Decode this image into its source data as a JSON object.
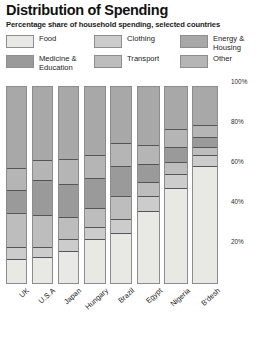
{
  "header": {
    "title": "Distribution of Spending",
    "subtitle": "Percentage share of household spending, selected countries"
  },
  "legend": {
    "items": [
      {
        "label": "Food",
        "color": "#e8e8e4",
        "key": "food"
      },
      {
        "label": "Medicine &\nEducation",
        "color": "#9a9a9a",
        "key": "medicine_education"
      },
      {
        "label": "Clothing",
        "color": "#cccccc",
        "key": "clothing"
      },
      {
        "label": "Transport",
        "color": "#bdbdbd",
        "key": "transport"
      },
      {
        "label": "Energy &\nHousing",
        "color": "#a8a8a8",
        "key": "energy_housing"
      },
      {
        "label": "Other",
        "color": "#b5b5b5",
        "key": "other"
      }
    ]
  },
  "axis": {
    "ticks": [
      {
        "label": "100%",
        "value": 100
      },
      {
        "label": "80%",
        "value": 80
      },
      {
        "label": "60%",
        "value": 60
      },
      {
        "label": "40%",
        "value": 40
      },
      {
        "label": "20%",
        "value": 20
      }
    ],
    "max": 100,
    "min": 0
  },
  "chart_data": {
    "type": "bar",
    "stacked": true,
    "title": "Distribution of Spending",
    "subtitle": "Percentage share of household spending, selected countries",
    "xlabel": "",
    "ylabel": "",
    "ylim": [
      0,
      100
    ],
    "grid": false,
    "legend_position": "top",
    "categories": [
      "UK",
      "U.S.A",
      "Japan",
      "Hungary",
      "Brazil",
      "Egypt",
      "Nigeria",
      "B'desh"
    ],
    "series": [
      {
        "name": "Food",
        "color": "#e8e8e4",
        "values": [
          12,
          13,
          16,
          22,
          25,
          36,
          48,
          59
        ]
      },
      {
        "name": "Clothing",
        "color": "#cccccc",
        "values": [
          6,
          5,
          6,
          6,
          7,
          8,
          7,
          6
        ]
      },
      {
        "name": "Transport",
        "color": "#bdbdbd",
        "values": [
          17,
          16,
          11,
          10,
          12,
          7,
          6,
          4
        ]
      },
      {
        "name": "Medicine & Education",
        "color": "#9a9a9a",
        "values": [
          12,
          18,
          17,
          15,
          15,
          9,
          8,
          5
        ]
      },
      {
        "name": "Other",
        "color": "#b5b5b5",
        "values": [
          11,
          10,
          13,
          12,
          12,
          10,
          9,
          6
        ]
      },
      {
        "name": "Energy & Housing",
        "color": "#a8a8a8",
        "values": [
          42,
          38,
          37,
          35,
          29,
          30,
          22,
          20
        ]
      }
    ]
  }
}
